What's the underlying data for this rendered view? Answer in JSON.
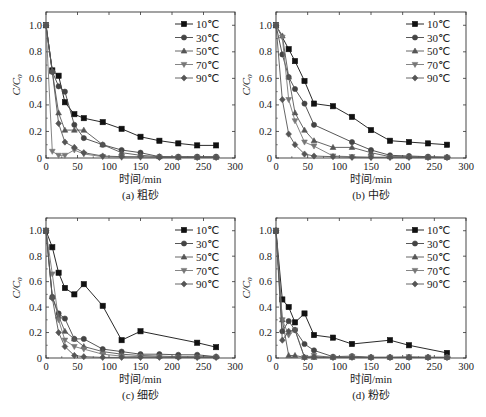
{
  "chart_data": [
    {
      "type": "line",
      "panel": "a",
      "caption": "(a) 粗砂",
      "xlabel": "时间/min",
      "ylabel": "C/C0",
      "xlim": [
        0,
        300
      ],
      "ylim": [
        0,
        1.1
      ],
      "xticks": [
        0,
        50,
        100,
        150,
        200,
        250,
        300
      ],
      "yticks": [
        0,
        0.2,
        0.4,
        0.6,
        0.8,
        1.0
      ],
      "legend_position": "upper right",
      "series": [
        {
          "name": "10℃",
          "marker": "square",
          "x": [
            0,
            10,
            20,
            30,
            45,
            60,
            90,
            120,
            150,
            180,
            210,
            240,
            270
          ],
          "values": [
            1.0,
            0.66,
            0.62,
            0.42,
            0.33,
            0.3,
            0.27,
            0.22,
            0.16,
            0.13,
            0.11,
            0.095,
            0.095
          ]
        },
        {
          "name": "30℃",
          "marker": "circle",
          "x": [
            0,
            10,
            20,
            30,
            45,
            60,
            90,
            120,
            150,
            180,
            210,
            240,
            270
          ],
          "values": [
            1.0,
            0.65,
            0.54,
            0.5,
            0.25,
            0.15,
            0.1,
            0.06,
            0.04,
            0.01,
            0.01,
            0.01,
            0.01
          ]
        },
        {
          "name": "50℃",
          "marker": "triangle-up",
          "x": [
            0,
            10,
            20,
            30,
            45,
            60,
            90,
            120,
            150,
            180,
            210,
            240,
            270
          ],
          "values": [
            1.0,
            0.65,
            0.34,
            0.21,
            0.21,
            0.21,
            0.1,
            0.04,
            0.02,
            0.01,
            0.005,
            0.005,
            0.005
          ]
        },
        {
          "name": "70℃",
          "marker": "triangle-down",
          "x": [
            0,
            10,
            20,
            30,
            45,
            60,
            90,
            120,
            150,
            180,
            210,
            240,
            270
          ],
          "values": [
            1.0,
            0.05,
            0.02,
            0.02,
            0.06,
            0.03,
            0.01,
            0.005,
            0.005,
            0.005,
            0.005,
            0.005,
            0.005
          ]
        },
        {
          "name": "90℃",
          "marker": "diamond",
          "x": [
            0,
            10,
            20,
            30,
            45,
            60,
            90,
            120,
            150,
            180,
            210,
            240,
            270
          ],
          "values": [
            1.0,
            0.65,
            0.26,
            0.12,
            0.08,
            0.04,
            0.015,
            0.01,
            0.01,
            0.005,
            0.005,
            0.005,
            0.005
          ]
        }
      ]
    },
    {
      "type": "line",
      "panel": "b",
      "caption": "(b) 中砂",
      "xlabel": "时间/min",
      "ylabel": "C/C0",
      "xlim": [
        0,
        300
      ],
      "ylim": [
        0,
        1.1
      ],
      "xticks": [
        0,
        50,
        100,
        150,
        200,
        250,
        300
      ],
      "yticks": [
        0,
        0.2,
        0.4,
        0.6,
        0.8,
        1.0
      ],
      "legend_position": "upper right",
      "series": [
        {
          "name": "10℃",
          "marker": "square",
          "x": [
            0,
            20,
            30,
            45,
            60,
            90,
            120,
            150,
            180,
            210,
            240,
            270
          ],
          "values": [
            1.0,
            0.82,
            0.73,
            0.58,
            0.41,
            0.39,
            0.31,
            0.21,
            0.13,
            0.12,
            0.11,
            0.1
          ]
        },
        {
          "name": "30℃",
          "marker": "circle",
          "x": [
            0,
            10,
            20,
            30,
            45,
            60,
            120,
            150,
            180,
            210,
            240,
            270
          ],
          "values": [
            1.0,
            0.78,
            0.61,
            0.52,
            0.41,
            0.25,
            0.12,
            0.06,
            0.02,
            0.015,
            0.01,
            0.005
          ]
        },
        {
          "name": "50℃",
          "marker": "triangle-up",
          "x": [
            0,
            10,
            20,
            30,
            45,
            60,
            90,
            120,
            150,
            180,
            210,
            240,
            270
          ],
          "values": [
            1.0,
            0.92,
            0.61,
            0.34,
            0.21,
            0.13,
            0.08,
            0.08,
            0.04,
            0.01,
            0.01,
            0.005,
            0.005
          ]
        },
        {
          "name": "70℃",
          "marker": "triangle-down",
          "x": [
            0,
            10,
            20,
            30,
            45,
            60,
            90,
            120,
            150,
            180,
            210,
            240,
            270
          ],
          "values": [
            1.0,
            0.91,
            0.44,
            0.28,
            0.12,
            0.09,
            0.015,
            0.01,
            0.005,
            0.005,
            0.005,
            0.005,
            0.005
          ]
        },
        {
          "name": "90℃",
          "marker": "diamond",
          "x": [
            0,
            10,
            20,
            30,
            45,
            60,
            90,
            120,
            150,
            180,
            210,
            240,
            270
          ],
          "values": [
            1.0,
            0.44,
            0.18,
            0.1,
            0.03,
            0.015,
            0.01,
            0.005,
            0.005,
            0.005,
            0.005,
            0.005,
            0.005
          ]
        }
      ]
    },
    {
      "type": "line",
      "panel": "c",
      "caption": "(c) 细砂",
      "xlabel": "时间/min",
      "ylabel": "C/C0",
      "xlim": [
        0,
        300
      ],
      "ylim": [
        0,
        1.1
      ],
      "xticks": [
        0,
        50,
        100,
        150,
        200,
        250,
        300
      ],
      "yticks": [
        0,
        0.2,
        0.4,
        0.6,
        0.8,
        1.0
      ],
      "legend_position": "upper right",
      "series": [
        {
          "name": "10℃",
          "marker": "square",
          "x": [
            0,
            10,
            20,
            30,
            45,
            60,
            90,
            120,
            150,
            240,
            270
          ],
          "values": [
            1.0,
            0.87,
            0.67,
            0.55,
            0.5,
            0.58,
            0.41,
            0.14,
            0.21,
            0.12,
            0.085
          ]
        },
        {
          "name": "30℃",
          "marker": "circle",
          "x": [
            0,
            10,
            20,
            30,
            45,
            60,
            90,
            120,
            150,
            180,
            210,
            240,
            270
          ],
          "values": [
            1.0,
            0.48,
            0.35,
            0.31,
            0.15,
            0.15,
            0.07,
            0.05,
            0.03,
            0.03,
            0.025,
            0.025,
            0.01
          ]
        },
        {
          "name": "50℃",
          "marker": "triangle-up",
          "x": [
            0,
            10,
            20,
            30,
            45,
            60,
            90,
            120,
            150,
            180,
            210,
            240,
            270
          ],
          "values": [
            1.0,
            0.48,
            0.33,
            0.21,
            0.15,
            0.09,
            0.05,
            0.03,
            0.02,
            0.015,
            0.01,
            0.01,
            0.01
          ]
        },
        {
          "name": "70℃",
          "marker": "triangle-down",
          "x": [
            0,
            10,
            20,
            30,
            45,
            60,
            90,
            120,
            150,
            180,
            210,
            240,
            270
          ],
          "values": [
            1.0,
            0.66,
            0.3,
            0.14,
            0.09,
            0.07,
            0.03,
            0.015,
            0.01,
            0.01,
            0.005,
            0.005,
            0.005
          ]
        },
        {
          "name": "90℃",
          "marker": "diamond",
          "x": [
            0,
            10,
            20,
            30,
            45,
            60,
            90,
            120,
            150,
            180,
            210,
            240,
            270
          ],
          "values": [
            1.0,
            0.47,
            0.2,
            0.09,
            0.02,
            0.01,
            0.005,
            0.005,
            0.005,
            0.005,
            0.005,
            0.005,
            0.005
          ]
        }
      ]
    },
    {
      "type": "line",
      "panel": "d",
      "caption": "(d) 粉砂",
      "xlabel": "时间/min",
      "ylabel": "C/C0",
      "xlim": [
        0,
        300
      ],
      "ylim": [
        0,
        1.1
      ],
      "xticks": [
        0,
        50,
        100,
        150,
        200,
        250,
        300
      ],
      "yticks": [
        0,
        0.2,
        0.4,
        0.6,
        0.8,
        1.0
      ],
      "legend_position": "upper right",
      "series": [
        {
          "name": "10℃",
          "marker": "square",
          "x": [
            0,
            10,
            20,
            30,
            45,
            60,
            90,
            120,
            180,
            210,
            270
          ],
          "values": [
            1.0,
            0.46,
            0.4,
            0.28,
            0.35,
            0.18,
            0.16,
            0.11,
            0.14,
            0.1,
            0.04
          ]
        },
        {
          "name": "30℃",
          "marker": "circle",
          "x": [
            0,
            10,
            20,
            30,
            45,
            60,
            90,
            120,
            150,
            180,
            210,
            240,
            270
          ],
          "values": [
            1.0,
            0.21,
            0.29,
            0.22,
            0.11,
            0.06,
            0.01,
            0.015,
            0.005,
            0.005,
            0.005,
            0.005,
            0.005
          ]
        },
        {
          "name": "50℃",
          "marker": "triangle-up",
          "x": [
            0,
            10,
            20,
            30,
            45,
            60,
            90,
            120,
            150,
            180,
            210,
            240,
            270
          ],
          "values": [
            1.0,
            0.3,
            0.02,
            0.02,
            0.005,
            0.005,
            0.005,
            0.005,
            0.005,
            0.005,
            0.005,
            0.005,
            0.005
          ]
        },
        {
          "name": "70℃",
          "marker": "triangle-down",
          "x": [
            0,
            10,
            20,
            30,
            45,
            60,
            90,
            120,
            150,
            180,
            210,
            240,
            270
          ],
          "values": [
            1.0,
            0.3,
            0.18,
            0.22,
            0.005,
            0.02,
            0.005,
            0.01,
            0.005,
            0.005,
            0.01,
            0.005,
            0.005
          ]
        },
        {
          "name": "90℃",
          "marker": "diamond",
          "x": [
            0,
            10,
            20,
            30,
            45,
            60,
            90,
            120,
            150,
            180,
            210,
            240,
            270
          ],
          "values": [
            1.0,
            0.14,
            0.21,
            0.22,
            0.005,
            0.01,
            0.005,
            0.005,
            0.005,
            0.005,
            0.005,
            0.005,
            0.005
          ]
        }
      ]
    }
  ],
  "layout": {
    "panels": [
      {
        "left": 46,
        "top": 12,
        "right": 235,
        "bottom": 158
      },
      {
        "left": 276,
        "top": 12,
        "right": 466,
        "bottom": 158
      },
      {
        "left": 46,
        "top": 218,
        "right": 235,
        "bottom": 358
      },
      {
        "left": 276,
        "top": 218,
        "right": 466,
        "bottom": 358
      }
    ],
    "series_colors": [
      "#111111",
      "#444444",
      "#555555",
      "#777777",
      "#555555"
    ]
  }
}
